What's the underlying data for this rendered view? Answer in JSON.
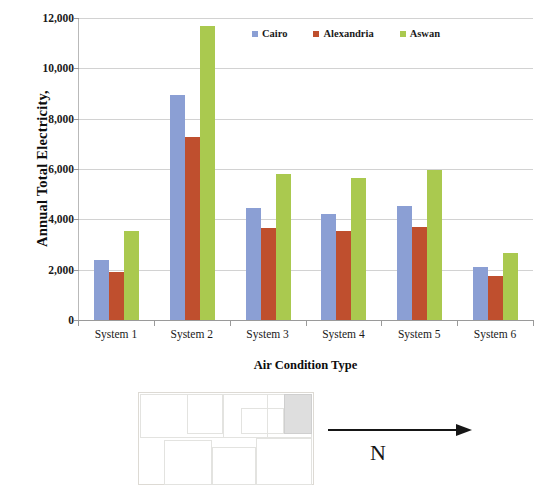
{
  "chart_data": {
    "type": "bar",
    "title": "",
    "xlabel": "Air Condition Type",
    "ylabel": "Annual Total Electricity,",
    "categories": [
      "System 1",
      "System 2",
      "System 3",
      "System 4",
      "System 5",
      "System 6"
    ],
    "series": [
      {
        "name": "Cairo",
        "color": "#8b9fd4",
        "values": [
          2380,
          8950,
          4470,
          4230,
          4520,
          2120
        ]
      },
      {
        "name": "Alexandria",
        "color": "#bf4f2e",
        "values": [
          1900,
          7270,
          3640,
          3520,
          3680,
          1760
        ]
      },
      {
        "name": "Aswan",
        "color": "#aac94f",
        "values": [
          3520,
          11700,
          5810,
          5630,
          5950,
          2670
        ]
      }
    ],
    "ylim": [
      0,
      12000
    ],
    "ytick_values": [
      0,
      2000,
      4000,
      6000,
      8000,
      10000,
      12000
    ],
    "ytick_labels": [
      "0",
      "2,000",
      "4,000",
      "6,000",
      "8,000",
      "10,000",
      "12,000"
    ],
    "grid": true,
    "legend_position": "top-right-inside"
  },
  "legend": {
    "items": [
      {
        "label": "Cairo",
        "swatch_name": "legend-swatch-cairo"
      },
      {
        "label": "Alexandria",
        "swatch_name": "legend-swatch-alexandria"
      },
      {
        "label": "Aswan",
        "swatch_name": "legend-swatch-aswan"
      }
    ]
  },
  "floorplan": {
    "north_label": "N",
    "arrow_name": "north-arrow-icon"
  }
}
